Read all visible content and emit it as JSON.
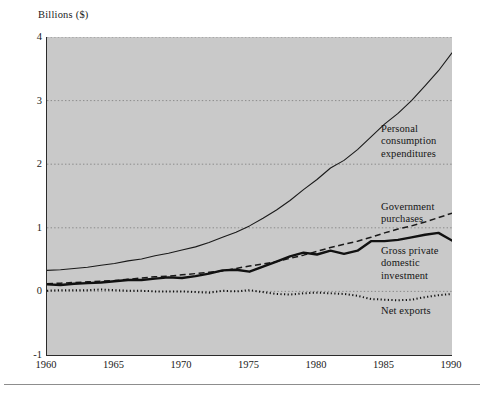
{
  "figure": {
    "y_axis_caption": "Billions ($)",
    "background_color": "#c9c9c9",
    "axis_color": "#2b2b2b",
    "grid_color": "#7a7a7a"
  },
  "annotations": {
    "pce": "Personal\nconsumption\nexpenditures",
    "pce_line1": "Personal",
    "pce_line2": "consumption",
    "pce_line3": "expenditures",
    "gov_line1": "Government",
    "gov_line2": "purchases",
    "gpdi_line1": "Gross private",
    "gpdi_line2": "domestic",
    "gpdi_line3": "investment",
    "netx_line1": "Net exports"
  },
  "chart_data": {
    "type": "line",
    "title": "",
    "subtitle": "",
    "xlabel": "",
    "ylabel": "Billions ($)",
    "xlim": [
      1960,
      1990
    ],
    "ylim": [
      -1,
      4
    ],
    "yticks": [
      -1,
      0,
      1,
      2,
      3,
      4
    ],
    "xticks": [
      1960,
      1965,
      1970,
      1975,
      1980,
      1985,
      1990
    ],
    "grid": "horizontal-dotted",
    "legend_position": "inline-right-annotations",
    "x": [
      1960,
      1961,
      1962,
      1963,
      1964,
      1965,
      1966,
      1967,
      1968,
      1969,
      1970,
      1971,
      1972,
      1973,
      1974,
      1975,
      1976,
      1977,
      1978,
      1979,
      1980,
      1981,
      1982,
      1983,
      1984,
      1985,
      1986,
      1987,
      1988,
      1989,
      1990
    ],
    "series": [
      {
        "name": "Personal consumption expenditures",
        "style": "solid-thin",
        "color": "#1a1a1a",
        "values": [
          0.33,
          0.34,
          0.36,
          0.38,
          0.41,
          0.44,
          0.48,
          0.51,
          0.56,
          0.6,
          0.65,
          0.7,
          0.77,
          0.85,
          0.93,
          1.03,
          1.15,
          1.28,
          1.43,
          1.6,
          1.76,
          1.94,
          2.06,
          2.23,
          2.43,
          2.63,
          2.8,
          3.0,
          3.23,
          3.47,
          3.75
        ]
      },
      {
        "name": "Government purchases",
        "style": "dashed",
        "color": "#1a1a1a",
        "values": [
          0.12,
          0.13,
          0.14,
          0.15,
          0.16,
          0.17,
          0.19,
          0.21,
          0.23,
          0.24,
          0.26,
          0.28,
          0.3,
          0.32,
          0.36,
          0.4,
          0.43,
          0.47,
          0.52,
          0.57,
          0.63,
          0.69,
          0.74,
          0.79,
          0.85,
          0.92,
          0.98,
          1.03,
          1.09,
          1.16,
          1.23
        ]
      },
      {
        "name": "Gross private domestic investment",
        "style": "solid-thick",
        "color": "#111111",
        "values": [
          0.11,
          0.1,
          0.12,
          0.13,
          0.14,
          0.16,
          0.18,
          0.18,
          0.2,
          0.22,
          0.21,
          0.24,
          0.28,
          0.33,
          0.34,
          0.31,
          0.39,
          0.47,
          0.55,
          0.61,
          0.58,
          0.64,
          0.59,
          0.64,
          0.79,
          0.79,
          0.81,
          0.85,
          0.89,
          0.92,
          0.8
        ]
      },
      {
        "name": "Net exports",
        "style": "dotted",
        "color": "#111111",
        "values": [
          0.01,
          0.02,
          0.02,
          0.02,
          0.03,
          0.02,
          0.01,
          0.01,
          0.0,
          0.0,
          0.0,
          -0.01,
          -0.02,
          0.01,
          0.0,
          0.02,
          -0.01,
          -0.04,
          -0.05,
          -0.03,
          -0.02,
          -0.03,
          -0.04,
          -0.07,
          -0.12,
          -0.13,
          -0.14,
          -0.13,
          -0.09,
          -0.06,
          -0.04
        ]
      }
    ]
  }
}
